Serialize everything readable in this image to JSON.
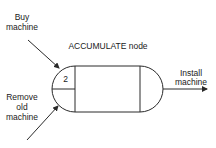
{
  "diagram": {
    "title": "ACCUMULATE node",
    "node": {
      "type": "ACCUMULATE",
      "count_label": "2"
    },
    "inputs": [
      {
        "label_lines": [
          "Buy",
          "machine"
        ]
      },
      {
        "label_lines": [
          "Remove",
          "old",
          "machine"
        ]
      }
    ],
    "output": {
      "label_lines": [
        "Install",
        "machine"
      ]
    },
    "colors": {
      "stroke": "#2a2a2a",
      "text": "#1a1a1a",
      "background": "#ffffff"
    }
  }
}
